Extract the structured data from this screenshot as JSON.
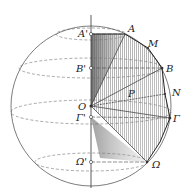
{
  "figure": {
    "labels": {
      "A_prime": "A'",
      "A": "A",
      "M": "M",
      "B_prime": "B'",
      "B": "B",
      "P": "P",
      "N": "N",
      "O": "O",
      "Gamma_prime": "Γ'",
      "Gamma": "Γ",
      "Omega_prime": "Ω'",
      "Omega": "Ω"
    },
    "colors": {
      "stroke": "#333333",
      "hatch": "#888888",
      "background": "#ffffff"
    }
  }
}
